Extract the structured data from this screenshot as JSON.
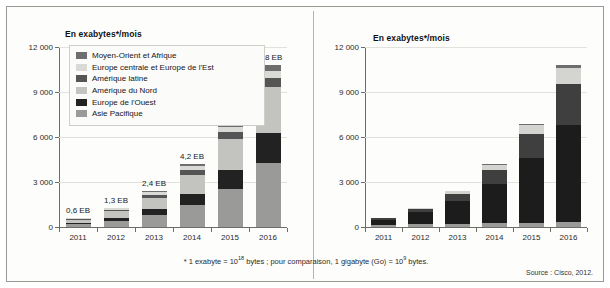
{
  "figure": {
    "footnote_prefix": "* 1 exabyte = 10",
    "footnote_exp1": "18",
    "footnote_middle": " bytes ; pour comparaison, 1 gigabyte (Go) = 10",
    "footnote_exp2": "9",
    "footnote_suffix": " bytes.",
    "source": "Source : Cisco, 2012."
  },
  "colors": {
    "moyen_orient": "#6e6e6e",
    "europe_centrale": "#d9d9d6",
    "amerique_latine": "#555555",
    "amerique_nord": "#c3c3c0",
    "europe_ouest": "#222222",
    "asie_pacifique": "#9a9a98",
    "autres": "#6e6e6e",
    "tablettes": "#d4d4d1",
    "ordinateurs": "#3f3f3f",
    "smartphones": "#1c1c1c",
    "non_smartphones": "#9a9a98",
    "axis": "#6d6d68",
    "grid": "#e2e2dd"
  },
  "chart_data": [
    {
      "type": "bar",
      "id": "left",
      "title": "En exabytes*/mois",
      "stacked": true,
      "xlabel": "",
      "ylabel": "En exabytes*/mois",
      "ylim": [
        0,
        12000
      ],
      "yticks": [
        0,
        3000,
        6000,
        9000,
        12000
      ],
      "ytick_labels": [
        "0",
        "3 000",
        "6 000",
        "9 000",
        "12 000"
      ],
      "grid": true,
      "legend_position": "top-left",
      "categories": [
        "2011",
        "2012",
        "2013",
        "2014",
        "2015",
        "2016"
      ],
      "annotations": [
        "0,6 EB",
        "1,3 EB",
        "2,4 EB",
        "4,2 EB",
        "6,9 EB",
        "10,8 EB"
      ],
      "totals": [
        600,
        1300,
        2400,
        4200,
        6900,
        10800
      ],
      "series": [
        {
          "name": "Asie Pacifique",
          "color_key": "asie_pacifique",
          "values": [
            180,
            420,
            800,
            1450,
            2550,
            4300
          ]
        },
        {
          "name": "Europe de l'Ouest",
          "color_key": "europe_ouest",
          "values": [
            110,
            210,
            400,
            750,
            1250,
            1950
          ]
        },
        {
          "name": "Amérique du Nord",
          "color_key": "amerique_nord",
          "values": [
            200,
            430,
            760,
            1300,
            2100,
            3100
          ]
        },
        {
          "name": "Amérique latine",
          "color_key": "amerique_latine",
          "values": [
            45,
            100,
            180,
            310,
            430,
            600
          ]
        },
        {
          "name": "Europe centrale et Europe de l'Est",
          "color_key": "europe_centrale",
          "values": [
            40,
            90,
            170,
            250,
            330,
            460
          ]
        },
        {
          "name": "Moyen-Orient et Afrique",
          "color_key": "moyen_orient",
          "values": [
            25,
            50,
            90,
            140,
            240,
            390
          ]
        }
      ],
      "legend": [
        {
          "label": "Moyen-Orient et Afrique",
          "color_key": "moyen_orient"
        },
        {
          "label": "Europe centrale et Europe de l'Est",
          "color_key": "europe_centrale"
        },
        {
          "label": "Amérique latine",
          "color_key": "amerique_latine"
        },
        {
          "label": "Amérique du Nord",
          "color_key": "amerique_nord"
        },
        {
          "label": "Europe de l'Ouest",
          "color_key": "europe_ouest"
        },
        {
          "label": "Asie Pacifique",
          "color_key": "asie_pacifique"
        }
      ]
    },
    {
      "type": "bar",
      "id": "right",
      "title": "En exabytes*/mois",
      "stacked": true,
      "xlabel": "",
      "ylabel": "En exabytes*/mois",
      "ylim": [
        0,
        12000
      ],
      "yticks": [
        0,
        3000,
        6000,
        9000,
        12000
      ],
      "ytick_labels": [
        "0",
        "3 000",
        "6 000",
        "9 000",
        "12 000"
      ],
      "grid": true,
      "legend_position": "top-left",
      "categories": [
        "2011",
        "2012",
        "2013",
        "2014",
        "2015",
        "2016"
      ],
      "totals": [
        600,
        1300,
        2400,
        4200,
        6900,
        10800
      ],
      "series": [
        {
          "name": "Non-smartphones",
          "color_key": "non_smartphones",
          "values": [
            150,
            200,
            230,
            260,
            290,
            330
          ]
        },
        {
          "name": "Smartphones",
          "color_key": "smartphones",
          "values": [
            330,
            780,
            1500,
            2600,
            4300,
            6500
          ]
        },
        {
          "name": "Ordinateurs portables et netbooks",
          "color_key": "ordinateurs",
          "values": [
            100,
            230,
            480,
            950,
            1600,
            2700
          ]
        },
        {
          "name": "Tablettes",
          "color_key": "tablettes",
          "values": [
            15,
            70,
            170,
            350,
            640,
            1050
          ]
        },
        {
          "name": "Autres",
          "color_key": "autres",
          "values": [
            5,
            20,
            20,
            40,
            70,
            220
          ]
        }
      ],
      "legend": [
        {
          "label": "Autres",
          "color_key": "autres"
        },
        {
          "label": "Tablettes",
          "color_key": "tablettes"
        },
        {
          "label": "Ordinateurs portables et netbooks",
          "color_key": "ordinateurs"
        },
        {
          "label": "Smartphones",
          "color_key": "smartphones"
        },
        {
          "label": "Non-smartphones",
          "color_key": "non_smartphones"
        }
      ]
    }
  ]
}
